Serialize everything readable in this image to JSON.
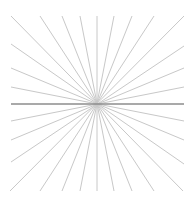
{
  "figure": {
    "type": "radial-lines",
    "center": [
      97,
      104
    ],
    "bounds": {
      "left": 11,
      "top": 16,
      "right": 184,
      "bottom": 191
    },
    "line_color": "#c8c8c8",
    "center_line_color": "#8c8c8c",
    "top_endpoints_x": [
      11,
      40,
      62,
      80,
      97,
      114,
      132,
      154,
      184
    ],
    "bottom_endpoints_x": [
      11,
      40,
      62,
      80,
      97,
      114,
      132,
      154,
      184
    ],
    "left_endpoints_y": [
      44,
      68,
      87,
      121,
      140,
      162
    ],
    "right_endpoints_y": [
      44,
      68,
      87,
      121,
      140,
      162
    ]
  }
}
